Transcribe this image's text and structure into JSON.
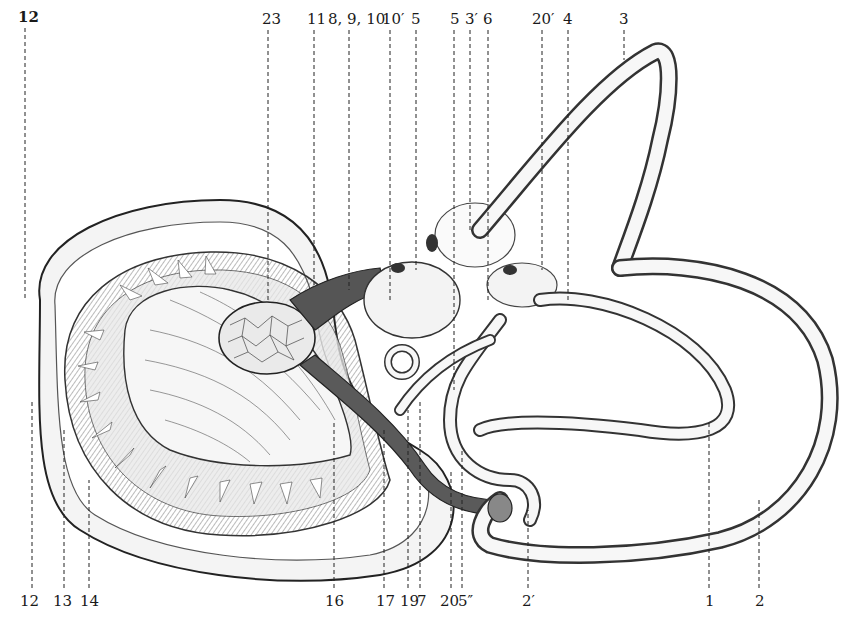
{
  "figure": {
    "ink_color": "#1a1a1a",
    "paper_color": "#ffffff",
    "top_labels": [
      {
        "text": "12",
        "x": 18,
        "y": 10,
        "line_x": 25
      },
      {
        "text": "23",
        "x": 268,
        "y": 12,
        "line_x": 268
      },
      {
        "text": "11",
        "x": 307,
        "y": 12,
        "line_x": 314
      },
      {
        "text": "8, 9, 10",
        "x": 330,
        "y": 12,
        "line_x": 349
      },
      {
        "text": "10′",
        "x": 383,
        "y": 12,
        "line_x": 390
      },
      {
        "text": "5",
        "x": 413,
        "y": 12,
        "line_x": 416
      },
      {
        "text": "5",
        "x": 451,
        "y": 12,
        "line_x": 454
      },
      {
        "text": "3′",
        "x": 466,
        "y": 12,
        "line_x": 470
      },
      {
        "text": "6",
        "x": 483,
        "y": 12,
        "line_x": 488
      },
      {
        "text": "20′",
        "x": 533,
        "y": 12,
        "line_x": 542
      },
      {
        "text": "4",
        "x": 564,
        "y": 12,
        "line_x": 568
      },
      {
        "text": "3",
        "x": 619,
        "y": 12,
        "line_x": 624
      }
    ],
    "bottom_labels": [
      {
        "text": "12",
        "x": 19,
        "y": 594,
        "line_x": 32
      },
      {
        "text": "13",
        "x": 54,
        "y": 594,
        "line_x": 64
      },
      {
        "text": "14",
        "x": 80,
        "y": 594,
        "line_x": 89
      },
      {
        "text": "16",
        "x": 325,
        "y": 594,
        "line_x": 334
      },
      {
        "text": "17",
        "x": 377,
        "y": 594,
        "line_x": 384
      },
      {
        "text": "19",
        "x": 400,
        "y": 594,
        "line_x": 408
      },
      {
        "text": "7",
        "x": 418,
        "y": 594,
        "line_x": 420
      },
      {
        "text": "20",
        "x": 440,
        "y": 594,
        "line_x": 451
      },
      {
        "text": "5″",
        "x": 458,
        "y": 594,
        "line_x": 462
      },
      {
        "text": "2′",
        "x": 522,
        "y": 594,
        "line_x": 528
      },
      {
        "text": "1",
        "x": 706,
        "y": 594,
        "line_x": 709
      },
      {
        "text": "2",
        "x": 755,
        "y": 594,
        "line_x": 759
      }
    ]
  }
}
